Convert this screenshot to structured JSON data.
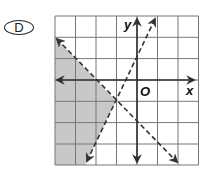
{
  "choice_label": "D",
  "graph": {
    "axis_labels": {
      "x": "x",
      "y": "y",
      "origin": "O"
    },
    "x_range": [
      -4,
      3
    ],
    "y_range": [
      -4,
      3
    ],
    "grid_step": 1,
    "lines": [
      {
        "equation": "y = -x - 2",
        "style": "dashed",
        "slope": -1,
        "intercept": -2
      },
      {
        "equation": "y = 2x + 1",
        "style": "dashed",
        "slope": 2,
        "intercept": 1
      }
    ],
    "intersection": [
      -1,
      -1
    ],
    "shaded_region": "below y = -x - 2 and left of y = 2x + 1",
    "colors": {
      "shade": "#c8c8c8",
      "grid": "#777777",
      "axis": "#333333",
      "line": "#333333"
    }
  }
}
